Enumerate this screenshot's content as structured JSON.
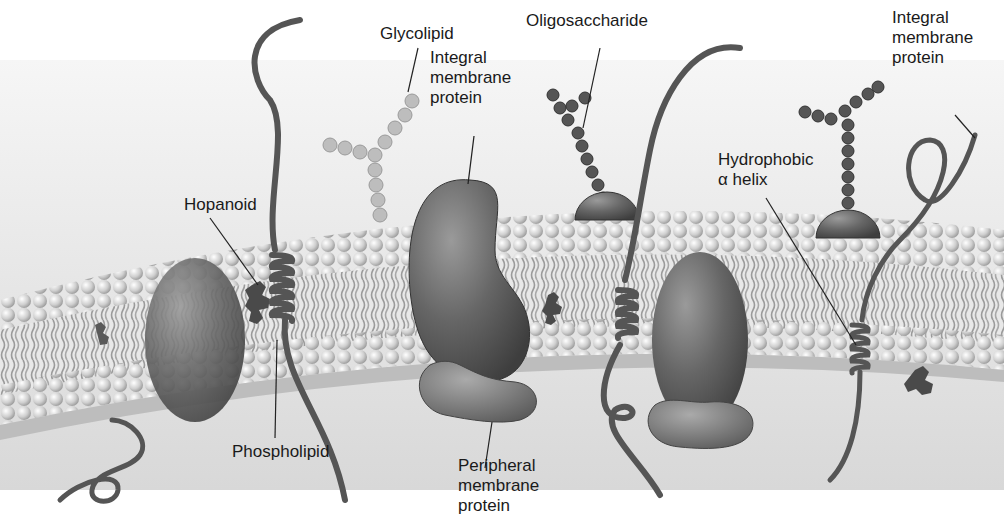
{
  "diagram": {
    "labels": {
      "glycolipid": "Glycolipid",
      "oligosaccharide": "Oligosaccharide",
      "integral_membrane_protein_center": [
        "Integral",
        "membrane",
        "protein"
      ],
      "integral_membrane_protein_right": [
        "Integral",
        "membrane",
        "protein"
      ],
      "hopanoid": "Hopanoid",
      "hydrophobic_alpha_helix": [
        "Hydrophobic",
        "α helix"
      ],
      "phospholipid": "Phospholipid",
      "peripheral_membrane_protein": [
        "Peripheral",
        "membrane",
        "protein"
      ]
    },
    "colors": {
      "background_top": "#f2f2f2",
      "background_bottom": "#d9d9d9",
      "phospholipid_head": "#d4d4d4",
      "protein_dark": "#555555",
      "protein_mid": "#7a7a7a",
      "glycolipid_sugar": "#bdbdbd",
      "oligosaccharide_sugar": "#555555",
      "leader_line": "#222222"
    }
  }
}
